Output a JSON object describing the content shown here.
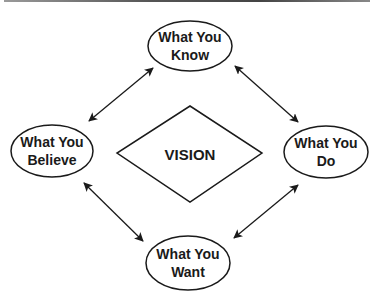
{
  "diagram": {
    "center": {
      "label": "VISION"
    },
    "nodes": [
      {
        "id": "know",
        "line1": "What You",
        "line2": "Know"
      },
      {
        "id": "believe",
        "line1": "What You",
        "line2": "Believe"
      },
      {
        "id": "do",
        "line1": "What You",
        "line2": "Do"
      },
      {
        "id": "want",
        "line1": "What You",
        "line2": "Want"
      }
    ],
    "edges": [
      {
        "from": "believe",
        "to": "know",
        "type": "bidirectional"
      },
      {
        "from": "know",
        "to": "do",
        "type": "bidirectional"
      },
      {
        "from": "believe",
        "to": "want",
        "type": "bidirectional"
      },
      {
        "from": "do",
        "to": "want",
        "type": "bidirectional"
      }
    ],
    "colors": {
      "stroke": "#1a1a1a",
      "background": "#ffffff"
    }
  }
}
